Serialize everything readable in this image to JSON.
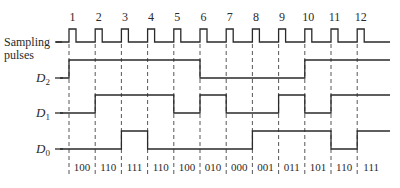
{
  "diagram": {
    "type": "timing-diagram",
    "signals": [
      {
        "name": "Sampling pulses",
        "label_lines": [
          "Sampling",
          "pulses"
        ],
        "kind": "clock"
      },
      {
        "name": "D2",
        "label_main": "D",
        "label_sub": "2",
        "transitions_at_pulse": [
          1,
          6,
          10
        ],
        "levels": [
          0,
          1,
          1,
          1,
          1,
          1,
          0,
          0,
          0,
          0,
          1,
          1,
          1
        ]
      },
      {
        "name": "D1",
        "label_main": "D",
        "label_sub": "1",
        "levels": [
          0,
          0,
          1,
          1,
          1,
          0,
          1,
          0,
          0,
          1,
          0,
          1,
          1
        ]
      },
      {
        "name": "D0",
        "label_main": "D",
        "label_sub": "0",
        "levels": [
          0,
          0,
          0,
          1,
          0,
          0,
          0,
          0,
          1,
          1,
          1,
          0,
          1
        ]
      }
    ],
    "pulse_numbers": [
      "1",
      "2",
      "3",
      "4",
      "5",
      "6",
      "7",
      "8",
      "9",
      "10",
      "11",
      "12"
    ],
    "state_labels": [
      "100",
      "110",
      "111",
      "110",
      "100",
      "010",
      "000",
      "001",
      "011",
      "101",
      "110",
      "111"
    ]
  }
}
